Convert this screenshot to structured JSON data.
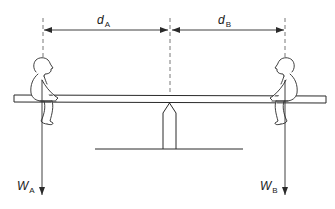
{
  "diagram": {
    "colors": {
      "stroke": "#2a2a2a",
      "dashed": "#555555",
      "background": "#ffffff"
    },
    "labels": {
      "distance_a": {
        "symbol": "d",
        "subscript": "A"
      },
      "distance_b": {
        "symbol": "d",
        "subscript": "B"
      },
      "weight_a": {
        "symbol": "W",
        "subscript": "A"
      },
      "weight_b": {
        "symbol": "W",
        "subscript": "B"
      }
    },
    "elements": {
      "left_child": "child figure A seated on left end of plank",
      "right_child": "child figure B seated on right end of plank",
      "plank": "seesaw plank",
      "fulcrum": "pointed pivot support",
      "ground": "ground line"
    }
  }
}
